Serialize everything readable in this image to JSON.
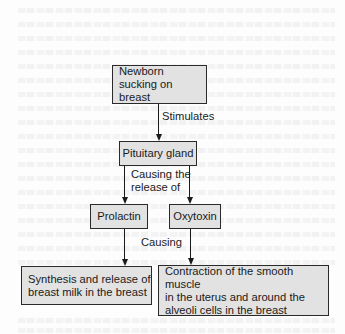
{
  "diagram": {
    "type": "flowchart",
    "nodes": {
      "newborn": {
        "label": "Newborn\nsucking on breast"
      },
      "pituitary": {
        "label": "Pituitary gland"
      },
      "prolactin": {
        "label": "Prolactin"
      },
      "oxytoxin": {
        "label": "Oxytoxin"
      },
      "synthesis": {
        "label": "Synthesis and release of\nbreast milk in the breast"
      },
      "contraction": {
        "label": "Contraction of the smooth muscle\nin the uterus and around the\nalveoli cells in the breast"
      }
    },
    "edge_labels": {
      "stimulates": "Stimulates",
      "causing_release": "Causing the\nrelease of",
      "causing": "Causing"
    },
    "edges": [
      {
        "from": "newborn",
        "to": "pituitary",
        "label": "Stimulates"
      },
      {
        "from": "pituitary",
        "to": "prolactin",
        "label": "Causing the release of"
      },
      {
        "from": "pituitary",
        "to": "oxytoxin",
        "label": "Causing the release of"
      },
      {
        "from": "prolactin",
        "to": "synthesis",
        "label": "Causing"
      },
      {
        "from": "oxytoxin",
        "to": "contraction",
        "label": "Causing"
      }
    ],
    "colors": {
      "box_fill": "#e2e2e2",
      "box_border": "#2a2a2a",
      "line": "#1a1a1a",
      "background": "#fdfdfd"
    }
  }
}
